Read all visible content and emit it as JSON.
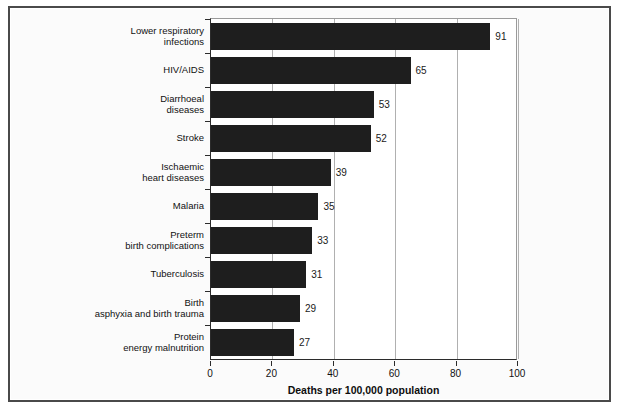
{
  "chart_data": {
    "type": "bar",
    "orientation": "horizontal",
    "title": "",
    "xlabel": "Deaths per 100,000 population",
    "ylabel": "",
    "xlim": [
      0,
      100
    ],
    "xticks": [
      0,
      20,
      40,
      60,
      80,
      100
    ],
    "grid": "vertical",
    "legend": "none",
    "bar_color": "#1e1e1e",
    "categories": [
      "Lower respiratory\ninfections",
      "HIV/AIDS",
      "Diarrhoeal\ndiseases",
      "Stroke",
      "Ischaemic\nheart diseases",
      "Malaria",
      "Preterm\nbirth complications",
      "Tuberculosis",
      "Birth\nasphyxia and birth trauma",
      "Protein\nenergy malnutrition"
    ],
    "values": [
      91,
      65,
      53,
      52,
      39,
      35,
      33,
      31,
      29,
      27
    ],
    "value_labels": [
      "91",
      "65",
      "53",
      "52",
      "39",
      "35",
      "33",
      "31",
      "29",
      "27"
    ]
  },
  "axis": {
    "tick_labels": [
      "0",
      "20",
      "40",
      "60",
      "80",
      "100"
    ],
    "title": "Deaths per 100,000 population"
  }
}
